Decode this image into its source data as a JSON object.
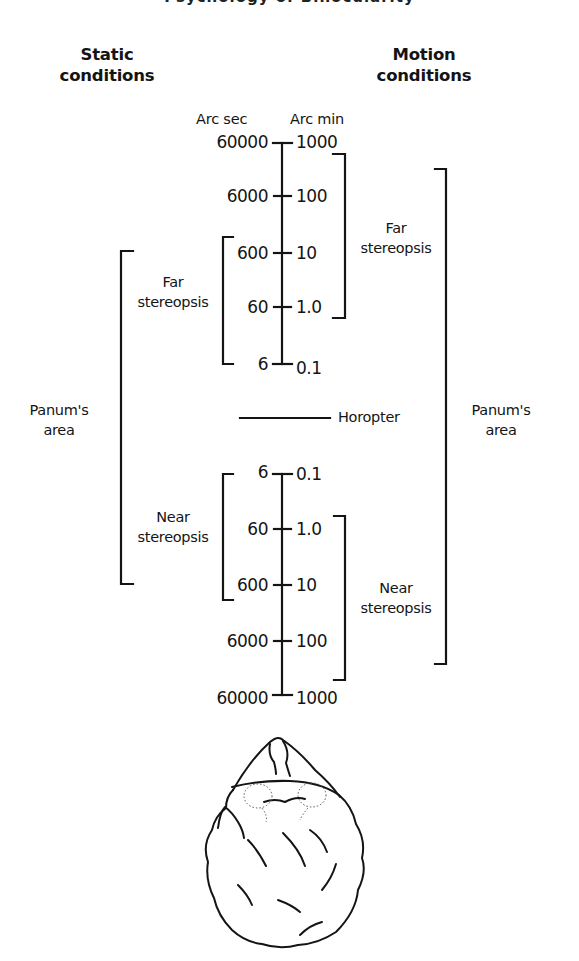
{
  "header": {
    "running_title_partial": "Psychology of Binocularity"
  },
  "columns": {
    "left_heading": [
      "Static",
      "conditions"
    ],
    "right_heading": [
      "Motion",
      "conditions"
    ]
  },
  "axis": {
    "left_unit": "Arc sec",
    "right_unit": "Arc min",
    "far_ticks": [
      {
        "arc_sec": "60000",
        "arc_min": "1000"
      },
      {
        "arc_sec": "6000",
        "arc_min": "100"
      },
      {
        "arc_sec": "600",
        "arc_min": "10"
      },
      {
        "arc_sec": "60",
        "arc_min": "1.0"
      },
      {
        "arc_sec": "6",
        "arc_min": "0.1"
      }
    ],
    "near_ticks": [
      {
        "arc_sec": "6",
        "arc_min": "0.1"
      },
      {
        "arc_sec": "60",
        "arc_min": "1.0"
      },
      {
        "arc_sec": "600",
        "arc_min": "10"
      },
      {
        "arc_sec": "6000",
        "arc_min": "100"
      },
      {
        "arc_sec": "60000",
        "arc_min": "1000"
      }
    ]
  },
  "brackets": {
    "static_far": [
      "Far",
      "stereopsis"
    ],
    "static_near": [
      "Near",
      "stereopsis"
    ],
    "static_panum": [
      "Panum's",
      "area"
    ],
    "motion_far": [
      "Far",
      "stereopsis"
    ],
    "motion_near": [
      "Near",
      "stereopsis"
    ],
    "motion_panum": [
      "Panum's",
      "area"
    ]
  },
  "horopter": {
    "label": "Horopter"
  },
  "illustration": {
    "subject": "head-top-view"
  },
  "colors": {
    "ink": "#141414",
    "background": "#ffffff"
  }
}
